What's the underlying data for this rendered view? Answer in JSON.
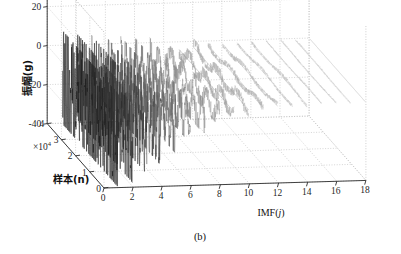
{
  "figure": {
    "caption": "(b)",
    "background": "#ffffff",
    "axis_color": "#2b2b2b",
    "grid_color": "#b9b9b9"
  },
  "chart_data": {
    "type": "line",
    "subtype": "3d-waterfall",
    "title": "",
    "caption": "(b)",
    "xlabel": "IMF(j)",
    "ylabel": "振幅(g)",
    "zlabel": "样本(n)",
    "zlabel_multiplier": "×10",
    "zlabel_multiplier_exp": "4",
    "xticks": [
      0,
      2,
      4,
      6,
      8,
      10,
      12,
      14,
      16,
      18
    ],
    "xticklabels": [
      "0",
      "2",
      "4",
      "6",
      "8",
      "10",
      "12",
      "14",
      "16",
      "18"
    ],
    "yticks": [
      -40,
      -20,
      0,
      20,
      40
    ],
    "yticklabels": [
      "-40",
      "-20",
      "0",
      "20",
      "40"
    ],
    "zticks": [
      0,
      1,
      2,
      3,
      4
    ],
    "zticklabels": [
      "0",
      "1",
      "2",
      "3",
      "4"
    ],
    "xlim": [
      0,
      18
    ],
    "ylim": [
      -40,
      40
    ],
    "zlim": [
      0,
      4
    ],
    "grid": true,
    "grid_style": "dotted",
    "legend": "none",
    "series_axis": "IMF index",
    "sample_axis_units": "samples ×10^4",
    "series": [
      {
        "name": "IMF 1",
        "imf": 1,
        "amplitude_range": [
          -40,
          8
        ],
        "peak_abs": 40,
        "color": "#141414",
        "density": "very-high"
      },
      {
        "name": "IMF 2",
        "imf": 2,
        "amplitude_range": [
          -38,
          6
        ],
        "peak_abs": 38,
        "color": "#1c1c1c",
        "density": "very-high"
      },
      {
        "name": "IMF 3",
        "imf": 3,
        "amplitude_range": [
          -34,
          5
        ],
        "peak_abs": 34,
        "color": "#2a2a2a",
        "density": "high"
      },
      {
        "name": "IMF 4",
        "imf": 4,
        "amplitude_range": [
          -30,
          4
        ],
        "peak_abs": 30,
        "color": "#3b3b3b",
        "density": "high"
      },
      {
        "name": "IMF 5",
        "imf": 5,
        "amplitude_range": [
          -24,
          4
        ],
        "peak_abs": 24,
        "color": "#555555",
        "density": "medium"
      },
      {
        "name": "IMF 6",
        "imf": 6,
        "amplitude_range": [
          -19,
          3
        ],
        "peak_abs": 19,
        "color": "#6a6a6a",
        "density": "medium"
      },
      {
        "name": "IMF 7",
        "imf": 7,
        "amplitude_range": [
          -15,
          3
        ],
        "peak_abs": 15,
        "color": "#7d7d7d",
        "density": "medium"
      },
      {
        "name": "IMF 8",
        "imf": 8,
        "amplitude_range": [
          -11,
          2
        ],
        "peak_abs": 11,
        "color": "#8d8d8d",
        "density": "low"
      },
      {
        "name": "IMF 9",
        "imf": 9,
        "amplitude_range": [
          -8,
          2
        ],
        "peak_abs": 8,
        "color": "#9a9a9a",
        "density": "low"
      },
      {
        "name": "IMF 10",
        "imf": 10,
        "amplitude_range": [
          -6,
          2
        ],
        "peak_abs": 6,
        "color": "#a4a4a4",
        "density": "low"
      },
      {
        "name": "IMF 11",
        "imf": 11,
        "amplitude_range": [
          -4,
          1
        ],
        "peak_abs": 4,
        "color": "#acacac",
        "density": "low"
      },
      {
        "name": "IMF 12",
        "imf": 12,
        "amplitude_range": [
          -3,
          1
        ],
        "peak_abs": 3,
        "color": "#b2b2b2",
        "density": "very-low"
      },
      {
        "name": "IMF 13",
        "imf": 13,
        "amplitude_range": [
          -2,
          1
        ],
        "peak_abs": 2,
        "color": "#b7b7b7",
        "density": "very-low"
      },
      {
        "name": "IMF 14",
        "imf": 14,
        "amplitude_range": [
          -2,
          1
        ],
        "peak_abs": 2,
        "color": "#bcbcbc",
        "density": "very-low"
      },
      {
        "name": "IMF 15",
        "imf": 15,
        "amplitude_range": [
          -1,
          1
        ],
        "peak_abs": 1,
        "color": "#c0c0c0",
        "density": "flat"
      },
      {
        "name": "IMF 16",
        "imf": 16,
        "amplitude_range": [
          -1,
          1
        ],
        "peak_abs": 1,
        "color": "#c4c4c4",
        "density": "flat"
      },
      {
        "name": "IMF 17",
        "imf": 17,
        "amplitude_range": [
          -1,
          1
        ],
        "peak_abs": 1,
        "color": "#c8c8c8",
        "density": "flat"
      },
      {
        "name": "IMF 18",
        "imf": 18,
        "amplitude_range": [
          0,
          0
        ],
        "peak_abs": 0,
        "color": "#cccccc",
        "density": "flat"
      }
    ]
  }
}
